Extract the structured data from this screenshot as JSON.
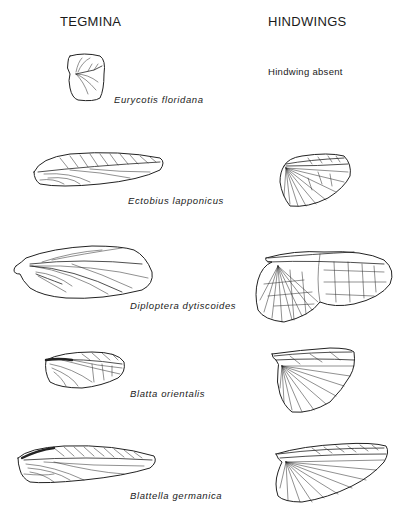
{
  "figure": {
    "columns": [
      {
        "key": "tegmina",
        "heading": "TEGMINA"
      },
      {
        "key": "hindwings",
        "heading": "HINDWINGS"
      }
    ],
    "species": [
      {
        "name": "Eurycotis floridana",
        "tegmen": "small rounded-square tegmen",
        "hindwing": "absent",
        "hindwing_note": "Hindwing absent"
      },
      {
        "name": "Ectobius lapponicus",
        "tegmen": "elongate oval tegmen",
        "hindwing": "fan-shaped hindwing"
      },
      {
        "name": "Diploptera dytiscoides",
        "tegmen": "broad oval tegmen",
        "hindwing": "large reticulate hindwing"
      },
      {
        "name": "Blatta orientalis",
        "tegmen": "short rounded tegmen",
        "hindwing": "triangular fan hindwing"
      },
      {
        "name": "Blattella germanica",
        "tegmen": "long narrow tegmen",
        "hindwing": "elongate fan hindwing"
      }
    ]
  },
  "colors": {
    "ink": "#1a1a1a",
    "background": "#ffffff"
  }
}
